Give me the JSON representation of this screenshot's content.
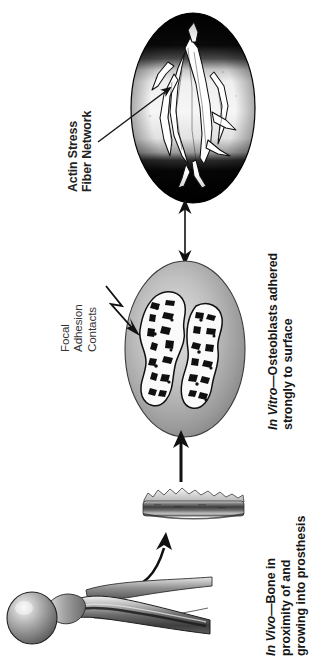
{
  "figure": {
    "background_color": "#ffffff",
    "orientation": "text rotated 90 degrees counter-clockwise"
  },
  "annotations": {
    "actin": {
      "name": "actin-stress-fiber-network",
      "lines": [
        "Actin Stress",
        "Fiber Network"
      ],
      "leader": "straight-arrow-up-right"
    },
    "focal": {
      "name": "focal-adhesion-contacts",
      "lines": [
        "Focal",
        "Adhesion",
        "Contacts"
      ],
      "leader": "zigzag-arrow-down-right"
    }
  },
  "captions": {
    "in_vitro": {
      "emphasis": "In Vitro",
      "lines": [
        "—Osteoblasts adhered",
        "strongly to surface"
      ],
      "full_text": "In Vitro—Osteoblasts adhered strongly to surface"
    },
    "in_vivo": {
      "emphasis": "In Vivo",
      "lines": [
        "—Bone in",
        "proximity of and",
        "growing into prosthesis"
      ],
      "full_text": "In Vivo—Bone in proximity of and growing into prosthesis"
    }
  },
  "panels": [
    {
      "id": "micrograph-oval",
      "label": "Fluorescence micrograph oval",
      "shape": "ellipse",
      "description": "Dark-to-light-to-dark horizontal gradient background with white branching actin stress fiber network",
      "colors": {
        "band_dark": "#0d0d0d",
        "band_light": "#f2f2f2",
        "fiber": "#ffffff",
        "fiber_outline": "#111111"
      }
    },
    {
      "id": "osteoblast-oval",
      "label": "Osteoblast cells oval",
      "shape": "ellipse",
      "description": "Grey radial-gradient oval containing two mottled white spread osteoblast cells with dark focal adhesion speckles",
      "colors": {
        "fill_light": "#d6d6d6",
        "fill_dark": "#7c7c7c",
        "cell": "#fafafa",
        "speckle": "#141414"
      }
    },
    {
      "id": "implant-substrate",
      "label": "Implant surface slab",
      "shape": "slab",
      "description": "Horizontal gradient slab with rough bone-like texture along the top edge",
      "colors": {
        "top": "#e8e8e8",
        "body_dark": "#4a4a4a",
        "body_light": "#cfcfcf"
      }
    },
    {
      "id": "femoral-prosthesis",
      "label": "Femoral hip prosthesis",
      "shape": "stem",
      "description": "Grey shaded femoral stem implant with spherical head at left, tapering to the right",
      "colors": {
        "highlight": "#f0f0f0",
        "mid": "#9a9a9a",
        "shadow": "#3c3c3c"
      }
    }
  ],
  "connectors": [
    {
      "id": "arrow-oval-to-oval",
      "type": "double-headed-arrow",
      "direction": "vertical",
      "from": "osteoblast-oval",
      "to": "micrograph-oval"
    },
    {
      "id": "arrow-slab-to-oval",
      "type": "arrow",
      "direction": "up",
      "from": "implant-substrate",
      "to": "osteoblast-oval"
    },
    {
      "id": "arrow-prosthesis-to-slab",
      "type": "curved-arrow",
      "direction": "up-right",
      "from": "femoral-prosthesis",
      "to": "implant-substrate"
    }
  ]
}
